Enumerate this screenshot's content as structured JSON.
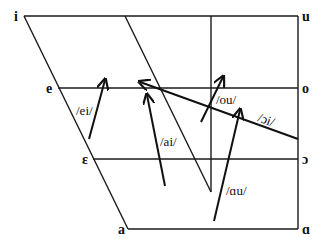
{
  "diagram": {
    "title": "",
    "type": "vowel-quadrilateral",
    "vowels": {
      "i": "i",
      "u": "u",
      "e": "e",
      "o": "o",
      "epsilon": "ε",
      "open_o": "ɔ",
      "a": "a",
      "script_a": "ɑ"
    },
    "diphthongs": {
      "ei": "/ei/",
      "ai": "/ai/",
      "ou": "/ou/",
      "oi": "/ɔi/",
      "au": "/ɑu/"
    },
    "colors": {
      "line": "#1a1a1a",
      "text": "#111111",
      "background": "#ffffff"
    }
  }
}
